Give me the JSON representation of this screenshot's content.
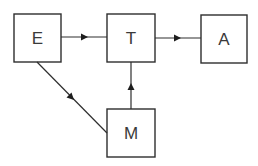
{
  "diagram": {
    "type": "flow",
    "colors": {
      "stroke": "#2e2e2e",
      "text": "#3a3a3a",
      "background": "#ffffff"
    },
    "nodes": [
      {
        "id": "E",
        "label": "E"
      },
      {
        "id": "T",
        "label": "T"
      },
      {
        "id": "A",
        "label": "A"
      },
      {
        "id": "M",
        "label": "M"
      }
    ],
    "edges": [
      {
        "from": "E",
        "to": "T"
      },
      {
        "from": "T",
        "to": "A"
      },
      {
        "from": "E",
        "to": "M"
      },
      {
        "from": "M",
        "to": "T"
      }
    ]
  }
}
